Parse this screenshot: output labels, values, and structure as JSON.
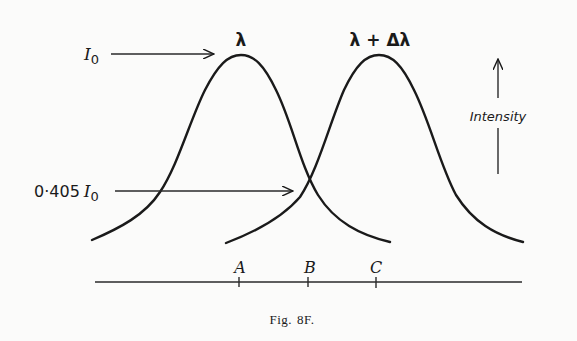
{
  "figure": {
    "caption_prefix": "Fig.",
    "caption_number": "8F."
  },
  "labels": {
    "peak1": "λ",
    "peak2": "λ + Δλ",
    "I0_symbol": "I",
    "I0_subscript": "0",
    "half_coef": "0·405",
    "half_symbol": "I",
    "half_subscript": "0",
    "intensity": "Intensity",
    "point_a": "A",
    "point_b": "B",
    "point_c": "C"
  },
  "colors": {
    "ink": "#1a1a1a",
    "paper": "#fbfbfa"
  }
}
